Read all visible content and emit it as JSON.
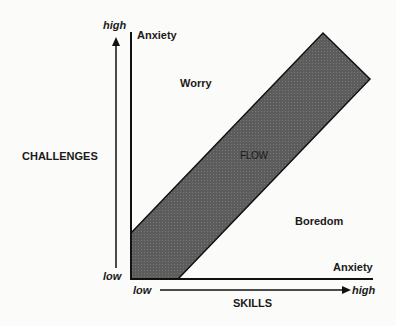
{
  "diagram": {
    "y_axis": {
      "label": "CHALLENGES",
      "high_label": "high",
      "low_label": "low"
    },
    "x_axis": {
      "label": "SKILLS",
      "high_label": "high",
      "low_label": "low"
    },
    "regions": {
      "anxiety_top": "Anxiety",
      "worry": "Worry",
      "flow": "FLOW",
      "boredom": "Boredom",
      "anxiety_bottom": "Anxiety"
    },
    "colors": {
      "band_fill": "#5a5a5a",
      "line": "#111111",
      "background": "#fbfbf9"
    },
    "band_polygon": [
      [
        131,
        233
      ],
      [
        323,
        33
      ],
      [
        370,
        79
      ],
      [
        178,
        279
      ],
      [
        131,
        279
      ]
    ]
  }
}
